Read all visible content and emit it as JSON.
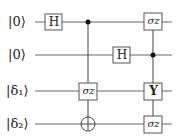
{
  "circuit": {
    "qubits": [
      {
        "label": "|0⟩",
        "y": 22
      },
      {
        "label": "|0⟩",
        "y": 55
      },
      {
        "label": "|δ₁⟩",
        "y": 91
      },
      {
        "label": "|δ₂⟩",
        "y": 124
      }
    ],
    "gates": [
      {
        "type": "box",
        "label": "H",
        "wire": 0,
        "x": 54
      },
      {
        "type": "control",
        "wire": 0,
        "x": 88
      },
      {
        "type": "box",
        "label": "σz",
        "wire": 2,
        "x": 88
      },
      {
        "type": "target",
        "wire": 3,
        "x": 88
      },
      {
        "type": "box",
        "label": "H",
        "wire": 1,
        "x": 122
      },
      {
        "type": "box",
        "label": "σz",
        "wire": 0,
        "x": 153
      },
      {
        "type": "control",
        "wire": 1,
        "x": 153
      },
      {
        "type": "box",
        "label": "Y",
        "wire": 2,
        "x": 153
      },
      {
        "type": "box",
        "label": "σz",
        "wire": 3,
        "x": 153
      }
    ],
    "colors": {
      "line": "#555555",
      "box_border": "#555555",
      "dot": "#111111"
    }
  }
}
